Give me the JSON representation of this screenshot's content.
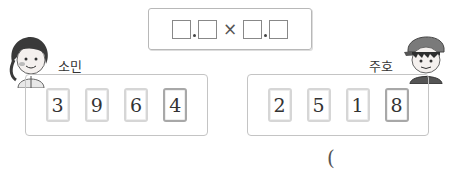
{
  "expression": {
    "template": "□.□ × □.□",
    "blanks": 4,
    "operator": "×",
    "decimal_point": "."
  },
  "players": [
    {
      "name": "소민",
      "cards": [
        "3",
        "9",
        "6",
        "4"
      ],
      "avatar": "girl-avatar"
    },
    {
      "name": "주호",
      "cards": [
        "2",
        "5",
        "1",
        "8"
      ],
      "avatar": "boy-avatar"
    }
  ],
  "answer": {
    "open_paren": "("
  }
}
